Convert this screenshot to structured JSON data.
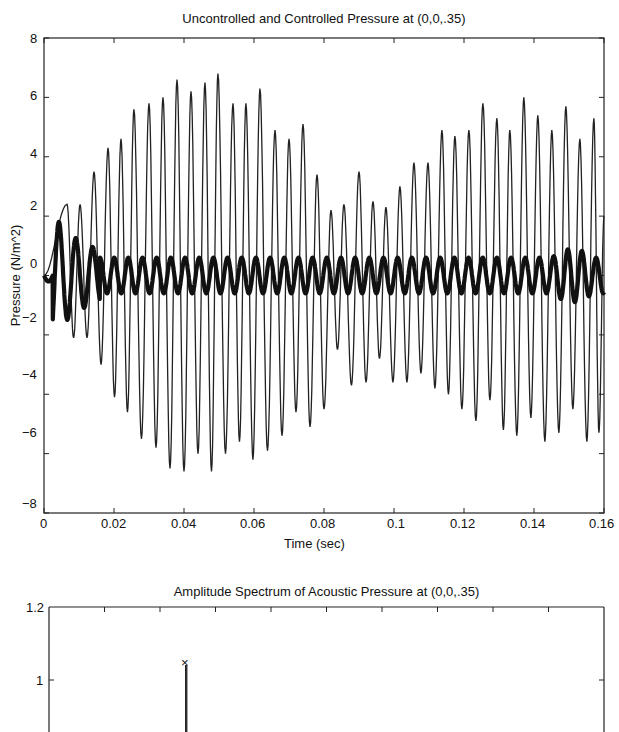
{
  "chart_data": [
    {
      "type": "line",
      "title": "Uncontrolled and Controlled Pressure at (0,0,.35)",
      "xlabel": "Time (sec)",
      "ylabel": "Pressure (N/m^2)",
      "xlim": [
        0,
        0.16
      ],
      "ylim": [
        -8,
        8
      ],
      "xticks": [
        "0",
        "0.02",
        "0.04",
        "0.06",
        "0.08",
        "0.1",
        "0.12",
        "0.14",
        "0.16"
      ],
      "yticks": [
        "8",
        "6",
        "4",
        "2",
        "0",
        "-2",
        "-4",
        "-6",
        "-8"
      ],
      "grid": false,
      "legend": null,
      "series": [
        {
          "name": "Uncontrolled (thin line)",
          "style": "thin",
          "description": "Oscillating pressure ~250 Hz with beating envelope; peak approx values listed",
          "peak_times": [
            0.0066,
            0.0103,
            0.0143,
            0.0183,
            0.022,
            0.0257,
            0.03,
            0.034,
            0.038,
            0.042,
            0.046,
            0.0497,
            0.054,
            0.0577,
            0.0617,
            0.066,
            0.07,
            0.074,
            0.078,
            0.082,
            0.0857,
            0.09,
            0.094,
            0.0977,
            0.1017,
            0.1057,
            0.1097,
            0.1137,
            0.1174,
            0.1214,
            0.1254,
            0.1294,
            0.1331,
            0.1371,
            0.1411,
            0.1451,
            0.1491,
            0.1531,
            0.1571,
            0.16
          ],
          "peak_values": [
            2.4,
            2.4,
            3.5,
            4.3,
            4.6,
            5.6,
            5.8,
            6.0,
            6.6,
            6.2,
            6.5,
            6.8,
            5.8,
            5.8,
            6.3,
            4.9,
            4.6,
            5.1,
            3.4,
            2.2,
            2.4,
            3.5,
            2.5,
            2.3,
            3.0,
            3.8,
            3.8,
            4.9,
            4.7,
            4.9,
            5.8,
            5.3,
            4.9,
            6.0,
            5.4,
            4.9,
            5.7,
            4.6,
            5.3,
            2.0
          ],
          "trough_values": [
            -2.1,
            -2.1,
            -3.0,
            -4.1,
            -4.6,
            -5.5,
            -5.8,
            -6.5,
            -6.6,
            -6.0,
            -6.6,
            -6.0,
            -5.6,
            -6.2,
            -5.9,
            -5.4,
            -4.6,
            -5.1,
            -4.5,
            -2.5,
            -3.7,
            -3.6,
            -2.8,
            -3.6,
            -3.6,
            -3.3,
            -3.8,
            -4.0,
            -4.5,
            -4.9,
            -4.2,
            -5.2,
            -5.4,
            -4.8,
            -5.6,
            -5.3,
            -4.5,
            -5.6,
            -5.3,
            -5.6
          ]
        },
        {
          "name": "Controlled (thick line)",
          "style": "thick",
          "description": "Residual pressure after control: oscillation ~±0.6 after initial transient",
          "x": [
            0,
            0.002,
            0.004,
            0.006,
            0.008,
            0.01,
            0.012,
            0.014,
            0.016,
            0.02,
            0.06,
            0.1,
            0.14,
            0.15,
            0.152,
            0.154,
            0.156,
            0.16
          ],
          "y": [
            0,
            -0.2,
            -1.3,
            1.1,
            0.7,
            -0.7,
            0.6,
            -0.3,
            0.8,
            0.6,
            0.6,
            0.6,
            0.7,
            -0.8,
            0.9,
            0.3,
            0.0,
            0.0
          ],
          "amplitude": 0.6
        }
      ]
    },
    {
      "type": "line",
      "title": "Amplitude Spectrum of Acoustic Pressure at (0,0,.35)",
      "yticks": [
        "1.2",
        "1"
      ],
      "ylim": [
        null,
        1.2
      ],
      "grid": false,
      "series": [
        {
          "name": "Amplitude spectrum",
          "description": "Single dominant spectral peak marked with x",
          "peak_marker": "x",
          "peak_value": 1.05
        }
      ]
    }
  ],
  "top": {
    "title": "Uncontrolled and Controlled Pressure at (0,0,.35)",
    "xlabel": "Time (sec)",
    "ylabel": "Pressure (N/m^2)",
    "xticks": [
      "0",
      "0.02",
      "0.04",
      "0.06",
      "0.08",
      "0.1",
      "0.12",
      "0.14",
      "0.16"
    ],
    "yticks": [
      "8",
      "6",
      "4",
      "2",
      "0",
      "−2",
      "−4",
      "−6",
      "−8"
    ]
  },
  "bottom": {
    "title": "Amplitude Spectrum of Acoustic Pressure at (0,0,.35)",
    "yticks": [
      "1.2",
      "1"
    ],
    "marker": "×"
  }
}
